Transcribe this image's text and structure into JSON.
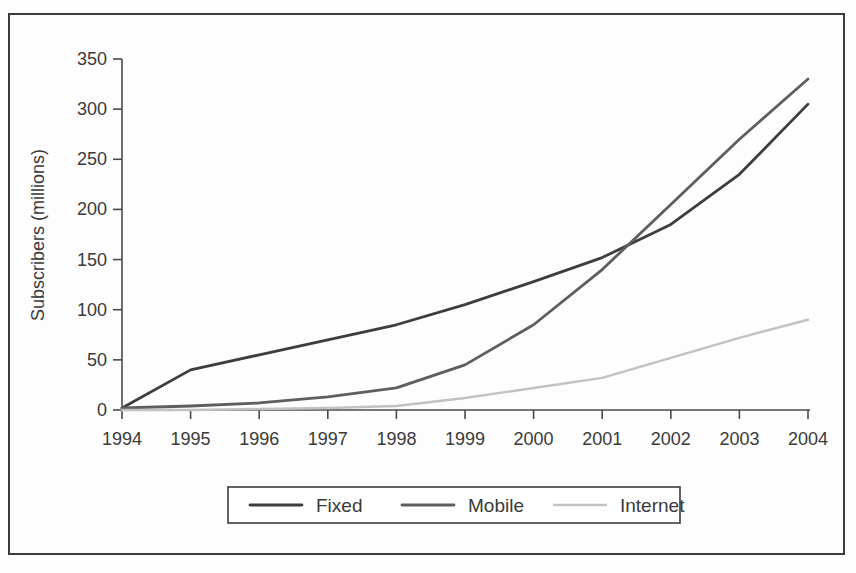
{
  "chart_data": {
    "type": "line",
    "title": "",
    "xlabel": "",
    "ylabel": "Subscribers (millions)",
    "x": [
      1994,
      1995,
      1996,
      1997,
      1998,
      1999,
      2000,
      2001,
      2002,
      2003,
      2004
    ],
    "categories": [
      "1994",
      "1995",
      "1996",
      "1997",
      "1998",
      "1999",
      "2000",
      "2001",
      "2002",
      "2003",
      "2004"
    ],
    "xlim": [
      1994,
      2004
    ],
    "ylim": [
      0,
      350
    ],
    "yticks": [
      0,
      50,
      100,
      150,
      200,
      250,
      300,
      350
    ],
    "ytick_labels": [
      "0",
      "50",
      "100",
      "150",
      "200",
      "250",
      "300",
      "350"
    ],
    "grid": false,
    "legend_position": "bottom",
    "series": [
      {
        "name": "Fixed",
        "color": "#3d3d3d",
        "values": [
          2,
          40,
          55,
          70,
          85,
          105,
          128,
          152,
          185,
          235,
          305
        ]
      },
      {
        "name": "Mobile",
        "color": "#5e5e5e",
        "values": [
          2,
          4,
          7,
          13,
          22,
          45,
          85,
          140,
          205,
          270,
          330
        ]
      },
      {
        "name": "Internet",
        "color": "#c2c2c2",
        "values": [
          0,
          0,
          1,
          2,
          4,
          12,
          22,
          32,
          52,
          72,
          90
        ]
      }
    ],
    "notes": {
      "crossover": "Mobile overtakes Fixed between 2002 and 2003",
      "fixed_start_year": 1995
    }
  },
  "axis": {
    "y_title": "Subscribers (millions)"
  },
  "legend": {
    "items": [
      {
        "label": "Fixed",
        "color": "#3d3d3d"
      },
      {
        "label": "Mobile",
        "color": "#5e5e5e"
      },
      {
        "label": "Internet",
        "color": "#c2c2c2"
      }
    ]
  },
  "style": {
    "axis_color": "#4a4a4a",
    "tick_label_color": "#3a3a3a",
    "frame_color": "#3b3b3b",
    "background": "#fdfdfd"
  }
}
